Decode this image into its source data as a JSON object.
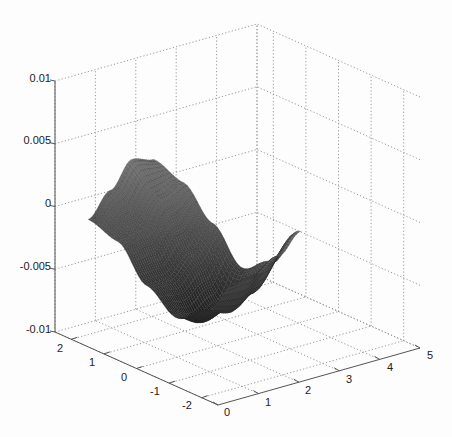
{
  "chart_data": {
    "type": "surface3d",
    "title": "",
    "xlabel": "",
    "ylabel": "",
    "zlabel": "",
    "xlim": [
      0,
      5
    ],
    "ylim": [
      -2.5,
      2.5
    ],
    "zlim": [
      -0.01,
      0.01
    ],
    "grid": true,
    "xticks": [
      "0",
      "1",
      "2",
      "3",
      "4",
      "5"
    ],
    "yticks": [
      "-2",
      "-1",
      "0",
      "1",
      "2"
    ],
    "zticks": [
      "-0.01",
      "-0.005",
      "0",
      "0.005",
      "0.01"
    ],
    "surface": {
      "colormap": "gray",
      "x_range": [
        0.62,
        2.25
      ],
      "y_range": [
        -2.25,
        2.25
      ],
      "description": "saddle-like surface, near 0 along left edge, rising peak (~0.0025) along back edge, dipping to ~-0.007 along front-right lobe",
      "z_samples_rows_x_cols_y": [
        [
          -0.0013,
          -0.0045,
          -0.006,
          -0.0045,
          -0.002,
          -0.0013
        ],
        [
          -0.001,
          -0.005,
          -0.0068,
          -0.0045,
          -0.0015,
          0.0005
        ],
        [
          0.0,
          -0.004,
          -0.006,
          -0.003,
          0.0005,
          0.0025
        ],
        [
          0.0015,
          -0.002,
          -0.0035,
          -0.001,
          0.0012,
          0.002
        ]
      ]
    }
  },
  "labels": {
    "z": {
      "p01": "0.01",
      "p005": "0.005",
      "zero": "0",
      "m005": "-0.005",
      "m01": "-0.01"
    },
    "y": {
      "p2": "2",
      "p1": "1",
      "zero": "0",
      "m1": "-1",
      "m2": "-2"
    },
    "x": {
      "x0": "0",
      "x1": "1",
      "x2": "2",
      "x3": "3",
      "x4": "4",
      "x5": "5"
    }
  },
  "colors": {
    "axis": "#555555",
    "grid": "#999999",
    "surface_dark": "#1a1a1a",
    "surface_light": "#9a9a9a"
  }
}
